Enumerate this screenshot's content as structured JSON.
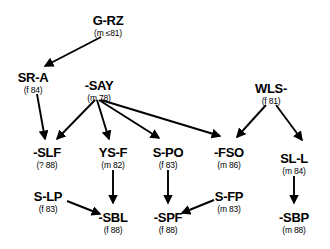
{
  "diagram": {
    "type": "transmission-network-tree",
    "nodes": [
      {
        "key": "g_rz",
        "id": "G-RZ",
        "meta": "(m ≤81)",
        "x": 108,
        "y": 14
      },
      {
        "key": "sr_a",
        "id": "SR-A",
        "meta": "(f 84)",
        "x": 33,
        "y": 71
      },
      {
        "key": "say",
        "id": "-SAY",
        "meta": "(m 78)",
        "x": 99,
        "y": 79
      },
      {
        "key": "wls",
        "id": "WLS-",
        "meta": "(f 81)",
        "x": 271,
        "y": 82
      },
      {
        "key": "slf",
        "id": "-SLF",
        "meta": "(? 88)",
        "x": 47,
        "y": 146
      },
      {
        "key": "ys_f",
        "id": "YS-F",
        "meta": "(m 82)",
        "x": 113,
        "y": 146
      },
      {
        "key": "s_po",
        "id": "S-PO",
        "meta": "(f 83)",
        "x": 168,
        "y": 146
      },
      {
        "key": "fso",
        "id": "-FSO",
        "meta": "(m 86)",
        "x": 229,
        "y": 146
      },
      {
        "key": "sl_l",
        "id": "SL-L",
        "meta": "(m 84)",
        "x": 294,
        "y": 152
      },
      {
        "key": "s_lp",
        "id": "S-LP",
        "meta": "(f 83)",
        "x": 48,
        "y": 190
      },
      {
        "key": "sbl",
        "id": "-SBL",
        "meta": "(f 88)",
        "x": 113,
        "y": 211
      },
      {
        "key": "spf",
        "id": "-SPF",
        "meta": "(f 88)",
        "x": 168,
        "y": 211
      },
      {
        "key": "s_fp",
        "id": "S-FP",
        "meta": "(m 83)",
        "x": 229,
        "y": 190
      },
      {
        "key": "sbp",
        "id": "-SBP",
        "meta": "(m 88)",
        "x": 294,
        "y": 211
      }
    ],
    "edges": [
      {
        "from": "g_rz",
        "to": "sr_a",
        "x1": 101,
        "y1": 37,
        "x2": 45,
        "y2": 66
      },
      {
        "from": "sr_a",
        "to": "slf",
        "x1": 37,
        "y1": 94,
        "x2": 45,
        "y2": 139
      },
      {
        "from": "say",
        "to": "slf",
        "x1": 95,
        "y1": 100,
        "x2": 57,
        "y2": 139
      },
      {
        "from": "say",
        "to": "ys_f",
        "x1": 97,
        "y1": 100,
        "x2": 109,
        "y2": 139
      },
      {
        "from": "say",
        "to": "s_po",
        "x1": 99,
        "y1": 100,
        "x2": 159,
        "y2": 138
      },
      {
        "from": "say",
        "to": "fso",
        "x1": 101,
        "y1": 100,
        "x2": 220,
        "y2": 136
      },
      {
        "from": "wls",
        "to": "fso",
        "x1": 266,
        "y1": 105,
        "x2": 237,
        "y2": 137
      },
      {
        "from": "wls",
        "to": "sl_l",
        "x1": 276,
        "y1": 105,
        "x2": 302,
        "y2": 140
      },
      {
        "from": "ys_f",
        "to": "sbl",
        "x1": 113,
        "y1": 170,
        "x2": 113,
        "y2": 203
      },
      {
        "from": "s_po",
        "to": "spf",
        "x1": 168,
        "y1": 170,
        "x2": 168,
        "y2": 203
      },
      {
        "from": "sl_l",
        "to": "sbp",
        "x1": 294,
        "y1": 176,
        "x2": 294,
        "y2": 203
      },
      {
        "from": "s_lp",
        "to": "sbl",
        "x1": 67,
        "y1": 201,
        "x2": 100,
        "y2": 214
      },
      {
        "from": "s_fp",
        "to": "spf",
        "x1": 214,
        "y1": 200,
        "x2": 182,
        "y2": 213
      }
    ],
    "colors": {
      "line": "#000000",
      "text": "#000000",
      "background": "#ffffff"
    }
  }
}
